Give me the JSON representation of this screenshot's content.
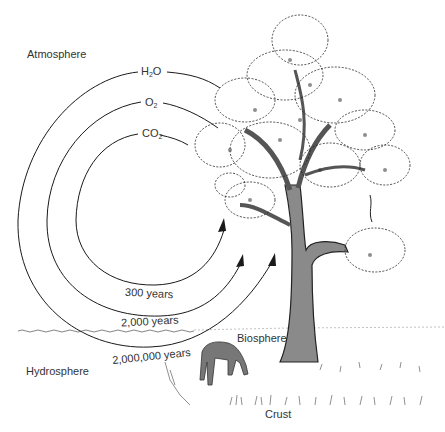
{
  "diagram": {
    "title": "",
    "regions": {
      "atmosphere": "Atmosphere",
      "hydrosphere": "Hydrosphere",
      "biosphere": "Biosphere",
      "crust": "Crust"
    },
    "cycles": [
      {
        "molecule": "H",
        "molecule_sub": "2",
        "molecule_tail": "O",
        "label": "H2O",
        "period": "2,000,000 years"
      },
      {
        "molecule": "O",
        "molecule_sub": "2",
        "molecule_tail": "",
        "label": "O2",
        "period": "2,000 years"
      },
      {
        "molecule": "CO",
        "molecule_sub": "2",
        "molecule_tail": "",
        "label": "CO2",
        "period": "300 years"
      }
    ],
    "colors": {
      "line": "#1a1a1a",
      "trunk": "#8a8a8a",
      "text": "#333333"
    }
  }
}
